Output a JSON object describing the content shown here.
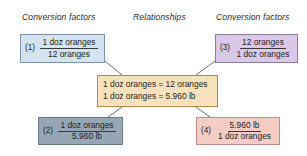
{
  "headers": {
    "left": "Conversion factors",
    "middle": "Relationships",
    "right": "Conversion factors"
  },
  "relationship_box": {
    "name": "relationships-box",
    "color": "#f7e2bd",
    "border_color": "#b08b4e",
    "lines": [
      "1 doz oranges = 12 oranges",
      "1 doz oranges = 5.960 lb"
    ]
  },
  "conversion_factors": [
    {
      "label": "(1)",
      "numerator": "1 doz oranges",
      "denominator": "12 oranges",
      "color": "#d4e3f2",
      "border_color": "#7d93ab",
      "position": "top-left"
    },
    {
      "label": "(2)",
      "numerator": "1 doz oranges",
      "denominator": "5.960 lb",
      "color": "#97a6b4",
      "border_color": "#6b7886",
      "position": "bottom-left"
    },
    {
      "label": "(3)",
      "numerator": "12 oranges",
      "denominator": "1 doz oranges",
      "color": "#d9c8e8",
      "border_color": "#8c7aa3",
      "position": "top-right"
    },
    {
      "label": "(4)",
      "numerator": "5.960 lb",
      "denominator": "1 doz oranges",
      "color": "#f6cdc6",
      "border_color": "#c08d86",
      "position": "bottom-right"
    }
  ],
  "connectors": [
    {
      "name": "connector-box1-to-center",
      "from": "(1)",
      "to": "relationships-box"
    },
    {
      "name": "connector-box2-to-center",
      "from": "(2)",
      "to": "relationships-box"
    },
    {
      "name": "connector-box3-to-center",
      "from": "(3)",
      "to": "relationships-box"
    },
    {
      "name": "connector-box4-to-center",
      "from": "(4)",
      "to": "relationships-box"
    }
  ],
  "background_color": "#ffffff",
  "text_color": "#231f20"
}
